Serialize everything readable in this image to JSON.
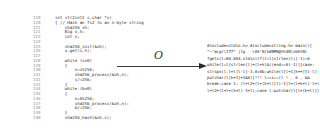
{
  "source_code": {
    "lines": [
      {
        "no": "119",
        "text": "int str2int2 s,char *s)"
      },
      {
        "no": "120",
        "text": "{ // Hash an fs2 to an n-byte string"
      },
      {
        "no": "121",
        "text": "    sha256 sh;"
      },
      {
        "no": "122",
        "text": "    Big x,5;"
      },
      {
        "no": "123",
        "text": "    int n;"
      },
      {
        "no": "124",
        "text": ""
      },
      {
        "no": "125",
        "text": "    sha256_init(&sh);"
      },
      {
        "no": "126",
        "text": "    x.get(s,5);"
      },
      {
        "no": "127",
        "text": ""
      },
      {
        "no": "128",
        "text": "    while (s>0)"
      },
      {
        "no": "129",
        "text": "    {"
      },
      {
        "no": "130",
        "text": "        n=s%256;"
      },
      {
        "no": "131",
        "text": "        sha256_process(&sh,n);"
      },
      {
        "no": "132",
        "text": "        s/=256;"
      },
      {
        "no": "133",
        "text": "    }"
      },
      {
        "no": "134",
        "text": "    while (b>0)"
      },
      {
        "no": "135",
        "text": "    {"
      },
      {
        "no": "136",
        "text": "        n=b%256;"
      },
      {
        "no": "137",
        "text": "        sha256_process(&sh,n);"
      },
      {
        "no": "138",
        "text": "        b/=256;"
      },
      {
        "no": "139",
        "text": "    }"
      },
      {
        "no": "140",
        "text": "    sha256_hash(&sh,s);"
      }
    ]
  },
  "transform": {
    "label": "O",
    "icon": "right-arrow"
  },
  "obfuscated_code": {
    "lines": [
      "#include<stdio.h> #include<string.h> main(){",
      "\"~'mcgr\\177\" |tg  -\\69'N(k#NMN@%%4N\\n0k%N)",
      "fgets(l=80,864,stdin))f(l=l[strlen(l)]-1)=0",
      "while(l=l[strlen(l)+(l+k)&((end==0)-1)]{case:",
      "strspn(l,l+l]l-l]-3,0=0b;while(l{l+1[k++]{l-l]-1",
      "putchar(l[k+1]+1&0)]!!! l==s==(l ! , 0 , &&",
      "break;case 1: (l+l2+(l+(k+l)[l)-1]l+(l+k+l)-l+)l]);",
      "l+l2+(l+l+(k+l)-1+l);case l:putchar(l[l+(k+l)])]3"
    ]
  }
}
